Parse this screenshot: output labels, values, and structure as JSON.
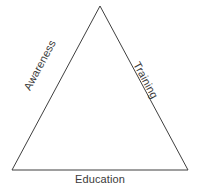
{
  "diagram": {
    "type": "triangle-model",
    "title": "",
    "background_color": "#ffffff",
    "stroke_color": "#3f3f3f",
    "stroke_width": 1,
    "text_color": "#3a3a3a",
    "vertices": {
      "apex": {
        "x": 100,
        "y": 6
      },
      "bottom_left": {
        "x": 12,
        "y": 170
      },
      "bottom_right": {
        "x": 188,
        "y": 170
      }
    },
    "edges": [
      {
        "id": "left-edge",
        "label": "Awareness",
        "from": "bottom_left",
        "to": "apex",
        "rotation_deg": -61.8,
        "orientation": "reading-upward"
      },
      {
        "id": "right-edge",
        "label": "Training",
        "from": "apex",
        "to": "bottom_right",
        "rotation_deg": 61.8,
        "orientation": "reading-downward"
      },
      {
        "id": "bottom-edge",
        "label": "Education",
        "from": "bottom_left",
        "to": "bottom_right",
        "rotation_deg": 0,
        "orientation": "horizontal"
      }
    ]
  },
  "labels": {
    "awareness": "Awareness",
    "training": "Training",
    "education": "Education"
  }
}
